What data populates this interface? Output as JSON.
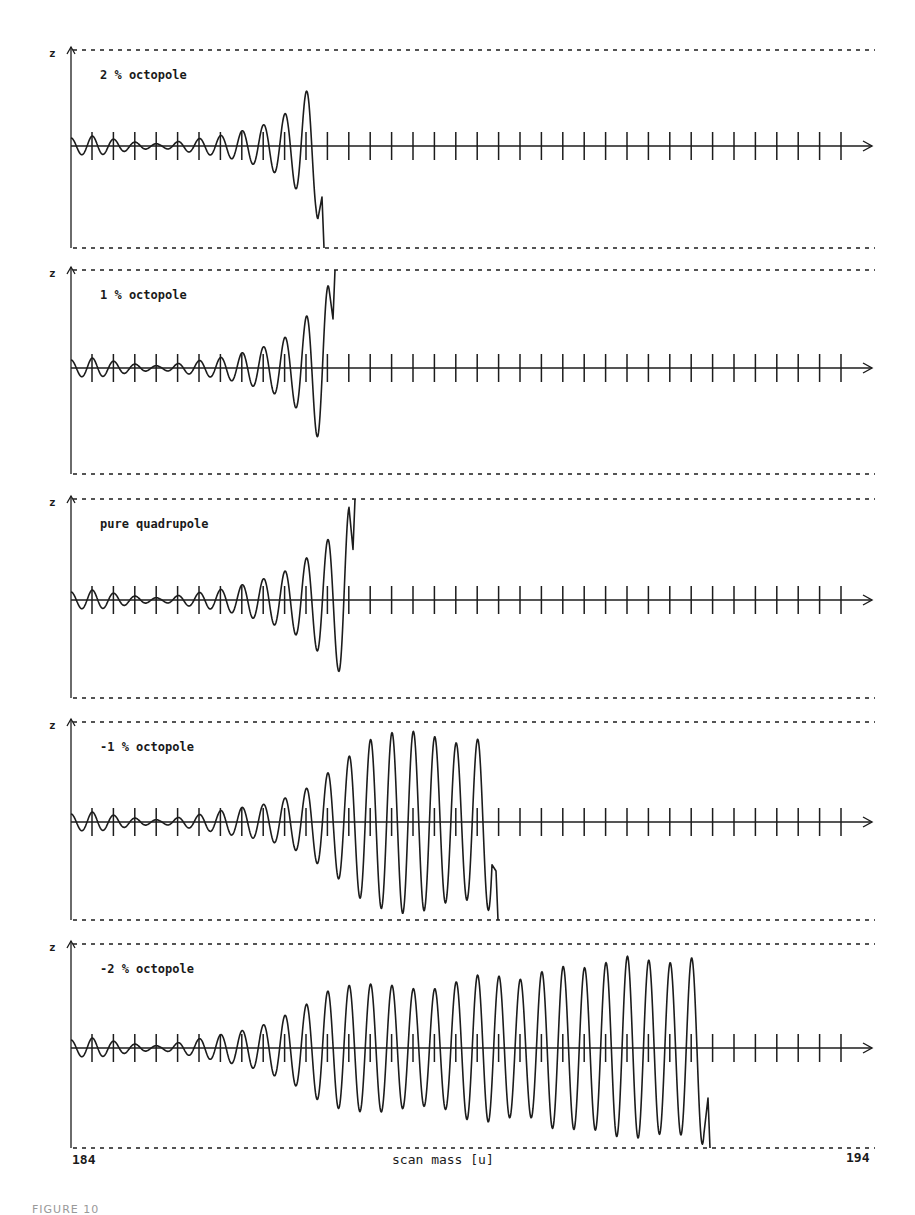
{
  "figure": {
    "caption": "FIGURE 10",
    "x_axis_label": "scan mass  [u]",
    "x_min_label": "184",
    "x_max_label": "194",
    "y_axis_label": "z"
  },
  "panels": [
    {
      "label": "2 % octopole",
      "top": 50,
      "base": 146,
      "bottom": 248,
      "end_x": 324,
      "escape": "down",
      "envelope": [
        [
          75,
          8
        ],
        [
          92,
          10
        ],
        [
          113,
          7
        ],
        [
          134,
          4
        ],
        [
          160,
          2
        ],
        [
          182,
          5
        ],
        [
          203,
          8
        ],
        [
          224,
          11
        ],
        [
          245,
          16
        ],
        [
          266,
          22
        ],
        [
          288,
          34
        ],
        [
          304,
          52
        ],
        [
          316,
          66
        ],
        [
          324,
          102
        ]
      ]
    },
    {
      "label": "1 % octopole",
      "top": 270,
      "base": 368,
      "bottom": 474,
      "end_x": 335,
      "escape": "up",
      "envelope": [
        [
          75,
          8
        ],
        [
          92,
          10
        ],
        [
          113,
          7
        ],
        [
          134,
          4
        ],
        [
          160,
          2
        ],
        [
          182,
          5
        ],
        [
          203,
          8
        ],
        [
          224,
          11
        ],
        [
          245,
          16
        ],
        [
          266,
          22
        ],
        [
          288,
          32
        ],
        [
          304,
          48
        ],
        [
          318,
          70
        ],
        [
          327,
          80
        ],
        [
          335,
          98
        ]
      ]
    },
    {
      "label": "pure quadrupole",
      "top": 499,
      "base": 600,
      "bottom": 698,
      "end_x": 355,
      "escape": "up",
      "envelope": [
        [
          75,
          8
        ],
        [
          92,
          10
        ],
        [
          113,
          7
        ],
        [
          134,
          4
        ],
        [
          160,
          2
        ],
        [
          182,
          5
        ],
        [
          203,
          8
        ],
        [
          224,
          11
        ],
        [
          245,
          16
        ],
        [
          266,
          22
        ],
        [
          288,
          30
        ],
        [
          304,
          40
        ],
        [
          322,
          55
        ],
        [
          338,
          70
        ],
        [
          347,
          90
        ],
        [
          355,
          101
        ]
      ]
    },
    {
      "label": "-1 % octopole",
      "top": 722,
      "base": 822,
      "bottom": 920,
      "end_x": 498,
      "escape": "down",
      "envelope": [
        [
          75,
          8
        ],
        [
          92,
          10
        ],
        [
          113,
          7
        ],
        [
          134,
          4
        ],
        [
          160,
          2
        ],
        [
          182,
          5
        ],
        [
          203,
          8
        ],
        [
          224,
          12
        ],
        [
          245,
          15
        ],
        [
          266,
          18
        ],
        [
          288,
          25
        ],
        [
          304,
          32
        ],
        [
          322,
          45
        ],
        [
          343,
          60
        ],
        [
          364,
          80
        ],
        [
          385,
          88
        ],
        [
          406,
          92
        ],
        [
          428,
          88
        ],
        [
          448,
          80
        ],
        [
          468,
          78
        ],
        [
          488,
          88
        ],
        [
          498,
          98
        ]
      ]
    },
    {
      "label": "-2 % octopole",
      "top": 944,
      "base": 1048,
      "bottom": 1148,
      "end_x": 710,
      "escape": "down",
      "envelope": [
        [
          75,
          8
        ],
        [
          92,
          10
        ],
        [
          113,
          7
        ],
        [
          134,
          4
        ],
        [
          160,
          2
        ],
        [
          182,
          6
        ],
        [
          203,
          10
        ],
        [
          224,
          14
        ],
        [
          245,
          18
        ],
        [
          266,
          24
        ],
        [
          288,
          34
        ],
        [
          304,
          42
        ],
        [
          322,
          55
        ],
        [
          343,
          62
        ],
        [
          364,
          64
        ],
        [
          385,
          64
        ],
        [
          406,
          60
        ],
        [
          428,
          58
        ],
        [
          448,
          62
        ],
        [
          468,
          72
        ],
        [
          488,
          74
        ],
        [
          508,
          70
        ],
        [
          528,
          68
        ],
        [
          548,
          80
        ],
        [
          568,
          82
        ],
        [
          588,
          80
        ],
        [
          608,
          86
        ],
        [
          628,
          92
        ],
        [
          648,
          88
        ],
        [
          668,
          85
        ],
        [
          688,
          88
        ],
        [
          702,
          96
        ],
        [
          710,
          100
        ]
      ]
    }
  ],
  "layout": {
    "axis_x": 71,
    "right_x": 875,
    "arrow_x": 872,
    "tick_start": 92,
    "tick_step": 21.4,
    "tick_count": 36,
    "period": 21.4
  },
  "chart_data": {
    "type": "line",
    "xlabel": "scan mass [u]",
    "ylabel": "z",
    "xlim": [
      184,
      194
    ],
    "grid": false,
    "legend_position": "in-panel labels (top-left)",
    "series": [
      {
        "name": "2 % octopole",
        "ejection_mass_u": 187.3,
        "ejection_direction": "-z",
        "behavior": "amplitude grows rapidly, ion ejected near 187.3 u"
      },
      {
        "name": "1 % octopole",
        "ejection_mass_u": 187.4,
        "ejection_direction": "+z",
        "behavior": "amplitude grows rapidly, ion ejected near 187.4 u"
      },
      {
        "name": "pure quadrupole",
        "ejection_mass_u": 187.6,
        "ejection_direction": "+z",
        "behavior": "amplitude grows rapidly, ion ejected near 187.6 u"
      },
      {
        "name": "-1 % octopole",
        "ejection_mass_u": 189.5,
        "ejection_direction": "-z",
        "behavior": "amplitude saturates ~190 then ejected near 189.5 u"
      },
      {
        "name": "-2 % octopole",
        "ejection_mass_u": 192.2,
        "ejection_direction": "-z",
        "behavior": "amplitude saturates with beating, ejected near 192.2 u"
      }
    ]
  }
}
